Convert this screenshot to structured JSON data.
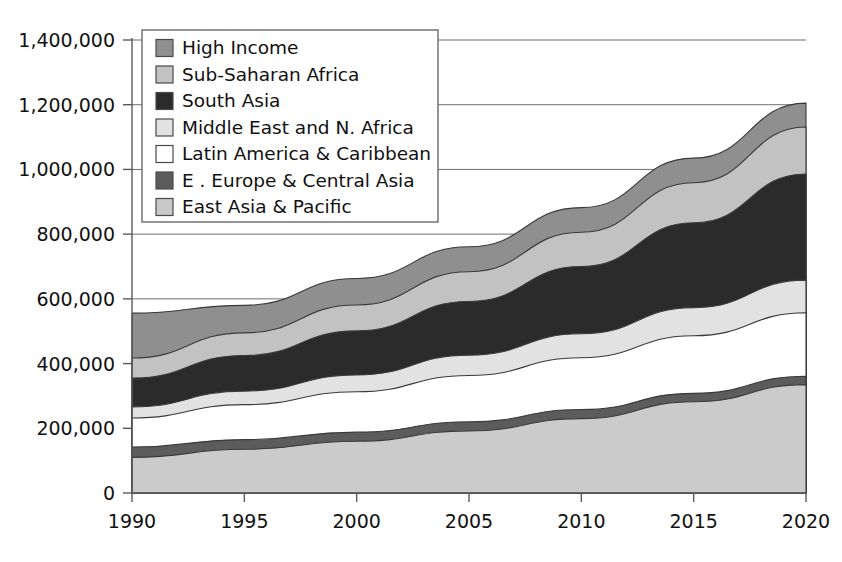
{
  "chart_data": {
    "type": "area",
    "title": "",
    "subtitle": "",
    "xlabel": "",
    "ylabel": "",
    "stacked": true,
    "grid": true,
    "legend_position": "top-left-inside",
    "x": [
      1990,
      1995,
      2000,
      2005,
      2010,
      2015,
      2020
    ],
    "xlim": [
      1990,
      2020
    ],
    "ylim": [
      0,
      1400000
    ],
    "xticks": [
      "1990",
      "1995",
      "2000",
      "2005",
      "2010",
      "2015",
      "2020"
    ],
    "yticks": [
      "0",
      "200,000",
      "400,000",
      "600,000",
      "800,000",
      "1,000,000",
      "1,200,000",
      "1,400,000"
    ],
    "ytick_values": [
      0,
      200000,
      400000,
      600000,
      800000,
      1000000,
      1200000,
      1400000
    ],
    "stack_order_bottom_to_top": [
      "East Asia & Pacific",
      "E . Europe & Central Asia",
      "Latin America & Caribbean",
      "Middle East and N. Africa",
      "South Asia",
      "Sub-Saharan Africa",
      "High Income"
    ],
    "series": [
      {
        "name": "East Asia & Pacific",
        "color": "#cbcbcb",
        "values": [
          110000,
          135000,
          160000,
          192000,
          230000,
          282000,
          335000
        ],
        "cumulative": [
          110000,
          135000,
          160000,
          192000,
          230000,
          282000,
          335000
        ]
      },
      {
        "name": "E . Europe & Central Asia",
        "color": "#5c5c5c",
        "values": [
          32000,
          30000,
          28000,
          28000,
          28000,
          26000,
          26000
        ],
        "cumulative": [
          142000,
          165000,
          188000,
          220000,
          258000,
          308000,
          361000
        ]
      },
      {
        "name": "Latin America & Caribbean",
        "color": "#ffffff",
        "values": [
          90000,
          108000,
          125000,
          143000,
          160000,
          178000,
          196000
        ],
        "cumulative": [
          232000,
          273000,
          313000,
          363000,
          418000,
          486000,
          557000
        ]
      },
      {
        "name": "Middle East and N. Africa",
        "color": "#e2e2e2",
        "values": [
          34000,
          42000,
          52000,
          63000,
          74000,
          87000,
          101000
        ],
        "cumulative": [
          266000,
          315000,
          365000,
          426000,
          492000,
          573000,
          658000
        ]
      },
      {
        "name": "South Asia",
        "color": "#2b2b2b",
        "values": [
          89000,
          110000,
          136000,
          166000,
          208000,
          262000,
          328000
        ],
        "cumulative": [
          355000,
          425000,
          501000,
          592000,
          700000,
          835000,
          986000
        ]
      },
      {
        "name": "Sub-Saharan Africa",
        "color": "#c2c2c2",
        "values": [
          62000,
          70000,
          80000,
          92000,
          106000,
          124000,
          145000
        ],
        "cumulative": [
          417000,
          495000,
          581000,
          684000,
          806000,
          959000,
          1131000
        ]
      },
      {
        "name": "High Income",
        "color": "#8f8f8f",
        "values": [
          139000,
          85000,
          82000,
          77000,
          76000,
          76000,
          74000
        ],
        "cumulative": [
          556000,
          580000,
          663000,
          761000,
          882000,
          1035000,
          1205000
        ]
      }
    ],
    "legend": [
      {
        "label": "High Income",
        "color": "#8f8f8f"
      },
      {
        "label": "Sub-Saharan Africa",
        "color": "#c2c2c2"
      },
      {
        "label": "South Asia",
        "color": "#2b2b2b"
      },
      {
        "label": "Middle East and N. Africa",
        "color": "#e2e2e2"
      },
      {
        "label": "Latin America & Caribbean",
        "color": "#ffffff"
      },
      {
        "label": "E . Europe & Central Asia",
        "color": "#5c5c5c"
      },
      {
        "label": "East Asia & Pacific",
        "color": "#c9c9c9"
      }
    ]
  }
}
